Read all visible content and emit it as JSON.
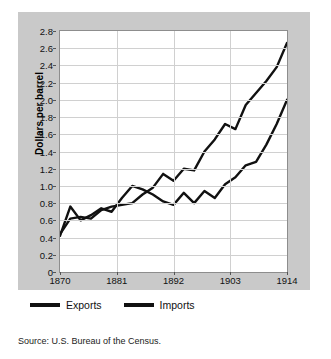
{
  "figure": {
    "panel_color": "#c9c9c9",
    "line_color": "#111111",
    "plot_background": "#ffffff",
    "grid_color": "#d0d0d0",
    "cut_top_text": ""
  },
  "source_note": "Source: U.S. Bureau of the Census.",
  "legend": {
    "items": [
      {
        "label": "Exports",
        "color": "#111111"
      },
      {
        "label": "Imports",
        "color": "#111111"
      }
    ]
  },
  "chart_data": {
    "type": "line",
    "title": "",
    "xlabel": "Year",
    "ylabel": "Dollars per barrel",
    "xlim": [
      1870,
      1914
    ],
    "ylim": [
      0,
      2.8
    ],
    "grid": true,
    "legend_position": "bottom",
    "xticks": [
      1870,
      1881,
      1892,
      1903,
      1914
    ],
    "xtick_labels": [
      "1870",
      "1881",
      "1892",
      "1903",
      "1914"
    ],
    "yticks": [
      0,
      0.2,
      0.4,
      0.6,
      0.8,
      1.0,
      1.2,
      1.4,
      1.6,
      1.8,
      2.0,
      2.2,
      2.4,
      2.6,
      2.8
    ],
    "ytick_labels": [
      "0",
      "0.2",
      "0.4",
      "0.6",
      "0.8",
      "1.0",
      "1.2",
      "1.4",
      "1.6",
      "1.8",
      "2.0",
      "2.2",
      "2.4",
      "2.6",
      "2.8"
    ],
    "x": [
      1870,
      1872,
      1874,
      1876,
      1878,
      1880,
      1882,
      1884,
      1886,
      1888,
      1890,
      1892,
      1894,
      1896,
      1898,
      1900,
      1902,
      1904,
      1906,
      1908,
      1910,
      1912,
      1914
    ],
    "series": [
      {
        "name": "Exports",
        "values": [
          0.42,
          0.76,
          0.6,
          0.66,
          0.74,
          0.7,
          0.86,
          1.0,
          0.96,
          0.9,
          0.82,
          0.78,
          0.92,
          0.8,
          0.94,
          0.86,
          1.02,
          1.1,
          1.24,
          1.28,
          1.48,
          1.72,
          2.0
        ]
      },
      {
        "name": "Imports",
        "values": [
          0.44,
          0.62,
          0.64,
          0.62,
          0.72,
          0.76,
          0.78,
          0.8,
          0.9,
          0.98,
          1.14,
          1.06,
          1.2,
          1.18,
          1.4,
          1.54,
          1.72,
          1.66,
          1.94,
          2.08,
          2.22,
          2.38,
          2.66
        ]
      }
    ]
  }
}
